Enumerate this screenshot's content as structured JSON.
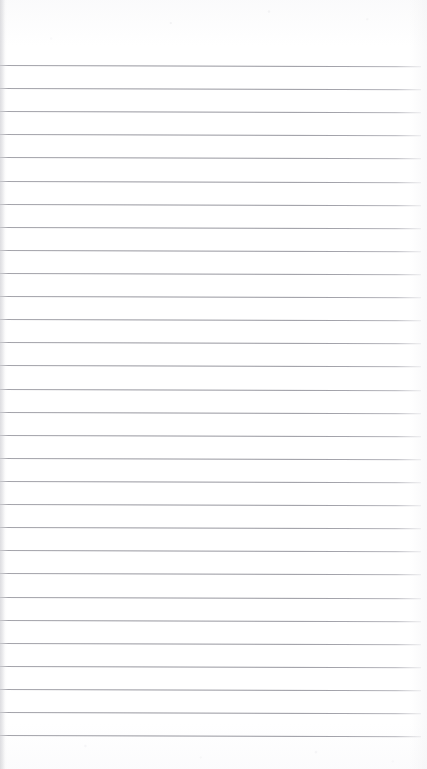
{
  "document": {
    "kind": "scanned-lined-paper",
    "title": "Blank ruled notebook page",
    "orientation": "portrait",
    "page_width_px": 427,
    "page_height_px": 769,
    "has_text_content": false,
    "text_content": "",
    "background_color": "#fefefe",
    "rule_color": "#9696a0",
    "rule_thickness_px": 1,
    "rule_count": 30,
    "first_rule_y_px": 65,
    "last_rule_y_px": 736,
    "rule_spacing_px": 23.1,
    "rule_left_x_px": 0,
    "rule_right_x_px": 421,
    "scan_skew_deg": 0.18,
    "top_margin_px": 65,
    "bottom_margin_px": 33,
    "left_edge_shadow": true,
    "rules": [
      {
        "index": 1,
        "y": 65.0
      },
      {
        "index": 2,
        "y": 88.1
      },
      {
        "index": 3,
        "y": 111.2
      },
      {
        "index": 4,
        "y": 134.3
      },
      {
        "index": 5,
        "y": 157.4
      },
      {
        "index": 6,
        "y": 180.6
      },
      {
        "index": 7,
        "y": 203.7
      },
      {
        "index": 8,
        "y": 226.8
      },
      {
        "index": 9,
        "y": 249.9
      },
      {
        "index": 10,
        "y": 273.0
      },
      {
        "index": 11,
        "y": 296.1
      },
      {
        "index": 12,
        "y": 319.2
      },
      {
        "index": 13,
        "y": 342.3
      },
      {
        "index": 14,
        "y": 365.4
      },
      {
        "index": 15,
        "y": 388.6
      },
      {
        "index": 16,
        "y": 411.7
      },
      {
        "index": 17,
        "y": 434.8
      },
      {
        "index": 18,
        "y": 457.9
      },
      {
        "index": 19,
        "y": 481.0
      },
      {
        "index": 20,
        "y": 504.1
      },
      {
        "index": 21,
        "y": 527.2
      },
      {
        "index": 22,
        "y": 550.3
      },
      {
        "index": 23,
        "y": 573.4
      },
      {
        "index": 24,
        "y": 596.6
      },
      {
        "index": 25,
        "y": 619.7
      },
      {
        "index": 26,
        "y": 642.8
      },
      {
        "index": 27,
        "y": 665.9
      },
      {
        "index": 28,
        "y": 689.0
      },
      {
        "index": 29,
        "y": 712.1
      },
      {
        "index": 30,
        "y": 735.2
      }
    ]
  }
}
